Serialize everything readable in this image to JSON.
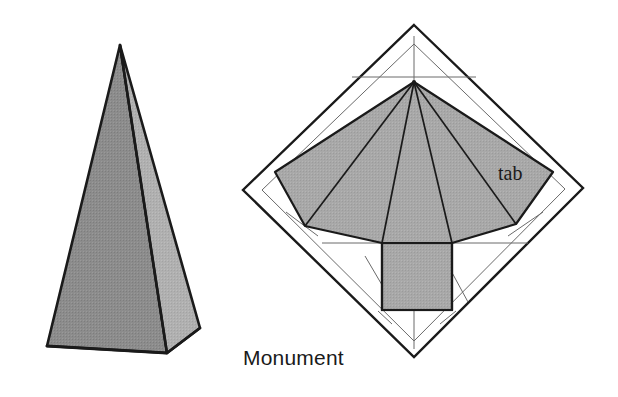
{
  "figure": {
    "background_color": "#ffffff",
    "width": 618,
    "height": 397,
    "outline_color": "#1a1a1a",
    "construction_line_color": "#555555",
    "labels": [
      {
        "id": "monument",
        "text": "Monument",
        "x": 243,
        "y": 365,
        "font": "sans-serif",
        "size_px": 21
      },
      {
        "id": "tab",
        "text": "tab",
        "x": 498,
        "y": 180,
        "font": "serif",
        "size_px": 20
      }
    ]
  },
  "solid": {
    "name": "monument-pyramid-solid",
    "apex": [
      120,
      45
    ],
    "base_left": [
      47,
      346
    ],
    "base_front": [
      167,
      353
    ],
    "base_right": [
      200,
      328
    ],
    "faces": [
      {
        "name": "front-left-face",
        "fill": "#8c8c8c",
        "points": "120,45 47,346 167,353"
      },
      {
        "name": "right-face",
        "fill": "#b0b0b0",
        "points": "120,45 167,353 200,328"
      }
    ],
    "edge_color": "#1a1a1a",
    "edge_width": 2.6
  },
  "net": {
    "name": "fold-out-net-pattern",
    "diamond": {
      "name": "card-outline-diamond",
      "points": "414,25 583,188 414,357 243,190",
      "stroke": "#1a1a1a",
      "stroke_width": 2.4,
      "fill": "none"
    },
    "inner_diamond": {
      "name": "inner-score-diamond",
      "points": "414,44 565,189 414,341 262,190",
      "stroke": "#555555",
      "stroke_width": 1
    },
    "apex": [
      414,
      82
    ],
    "fan": {
      "name": "four-triangle-fan",
      "fill": "#a8a8a8",
      "outline": "414,82 275,172 305,226 382,243 452,243 516,224 553,172",
      "fold_lines": [
        "414,82 275,172",
        "414,82 305,226",
        "414,82 382,243",
        "414,82 452,243",
        "414,82 516,224",
        "414,82 553,172"
      ]
    },
    "base_rect": {
      "name": "square-base-panel",
      "x": 382,
      "y": 243,
      "width": 70,
      "height": 67,
      "fill": "#a8a8a8",
      "stroke": "#1a1a1a",
      "stroke_width": 2.2
    },
    "construction_lines": [
      "414,36 414,82",
      "356,76 470,76",
      "414,310 414,348",
      "325,243 395,243",
      "440,243 524,243",
      "289,214 320,235",
      "366,255 392,300",
      "436,255 462,300",
      "505,235 540,214",
      "380,311 392,322",
      "440,322 454,311"
    ]
  }
}
